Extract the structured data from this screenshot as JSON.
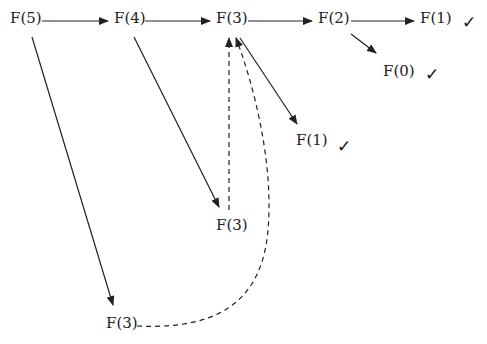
{
  "diagram": {
    "type": "recursion-tree",
    "nodes": [
      {
        "id": "n1",
        "label": "F(5)",
        "x": 10,
        "y": 11
      },
      {
        "id": "n2",
        "label": "F(4)",
        "x": 114,
        "y": 11
      },
      {
        "id": "n3",
        "label": "F(3)",
        "x": 216,
        "y": 11
      },
      {
        "id": "n4",
        "label": "F(2)",
        "x": 318,
        "y": 11
      },
      {
        "id": "n5",
        "label": "F(1)",
        "x": 420,
        "y": 11
      },
      {
        "id": "n6",
        "label": "F(0)",
        "x": 383,
        "y": 64
      },
      {
        "id": "n7",
        "label": "F(1)",
        "x": 296,
        "y": 133
      },
      {
        "id": "n8",
        "label": "F(3)",
        "x": 216,
        "y": 218
      },
      {
        "id": "n9",
        "label": "F(3)",
        "x": 106,
        "y": 316
      }
    ],
    "checkmarks": [
      {
        "for": "n5",
        "symbol": "✓",
        "x": 462,
        "y": 14
      },
      {
        "for": "n6",
        "symbol": "✓",
        "x": 425,
        "y": 66
      },
      {
        "for": "n7",
        "symbol": "✓",
        "x": 337,
        "y": 138
      }
    ],
    "edges": [
      {
        "from": "n1",
        "to": "n2",
        "style": "solid"
      },
      {
        "from": "n2",
        "to": "n3",
        "style": "solid"
      },
      {
        "from": "n3",
        "to": "n4",
        "style": "solid"
      },
      {
        "from": "n4",
        "to": "n5",
        "style": "solid"
      },
      {
        "from": "n4",
        "to": "n6",
        "style": "solid"
      },
      {
        "from": "n3",
        "to": "n7",
        "style": "solid"
      },
      {
        "from": "n2",
        "to": "n8",
        "style": "solid"
      },
      {
        "from": "n1",
        "to": "n9",
        "style": "solid"
      },
      {
        "from": "n8",
        "to": "n3",
        "style": "dashed"
      },
      {
        "from": "n9",
        "to": "n3",
        "style": "dashed"
      }
    ]
  }
}
